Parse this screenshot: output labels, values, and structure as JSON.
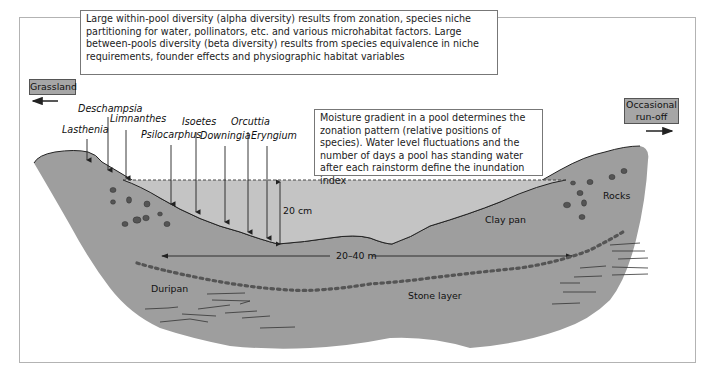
{
  "diagram": {
    "alpha_beta_note": "Large within-pool diversity (alpha diversity) results from zonation, species niche partitioning for water, pollinators, etc. and various microhabitat factors. Large between-pools diversity (beta diversity) results from species equivalence in niche requirements, founder effects and physiographic habitat variables",
    "moisture_note": "Moisture gradient in a pool determines the zonation pattern (relative positions of species). Water level fluctuations and the number of days a pool has standing water after each rainstorm define the inundation index",
    "left_tag": "Grassland",
    "right_tag_line1": "Occasional",
    "right_tag_line2": "run-off",
    "species": [
      "Lasthenia",
      "Deschampsia",
      "Limnanthes",
      "Psilocarphus",
      "Isoetes",
      "Downingia",
      "Orcuttia",
      "Eryngium"
    ],
    "labels": {
      "depth": "20 cm",
      "width": "20–40 m",
      "clay_pan": "Clay pan",
      "rocks": "Rocks",
      "duripan": "Duripan",
      "stone_layer": "Stone layer"
    },
    "colors": {
      "soil": "#9e9e9e",
      "water": "#c4c4c4",
      "tag": "#a6a6a6",
      "rock": "#555555"
    }
  }
}
